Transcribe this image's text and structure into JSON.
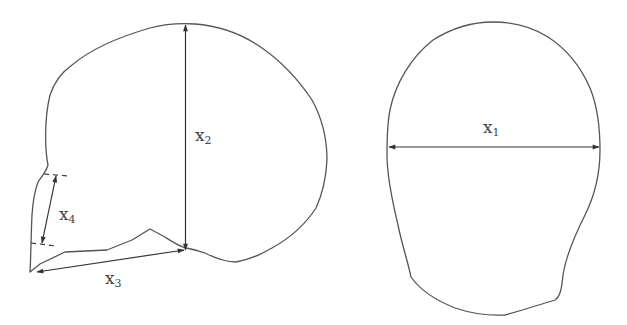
{
  "figure": {
    "views": [
      {
        "name": "lateral-view",
        "measurements": [
          "x2",
          "x3",
          "x4"
        ]
      },
      {
        "name": "frontal-view",
        "measurements": [
          "x1"
        ]
      }
    ]
  },
  "labels": {
    "x1": {
      "base": "x",
      "sub": "1"
    },
    "x2": {
      "base": "x",
      "sub": "2"
    },
    "x3": {
      "base": "x",
      "sub": "3"
    },
    "x4": {
      "base": "x",
      "sub": "4"
    }
  },
  "colors": {
    "outline": "#555555",
    "dimension_line": "#333333",
    "label_text": "#444444",
    "background": "#ffffff"
  }
}
